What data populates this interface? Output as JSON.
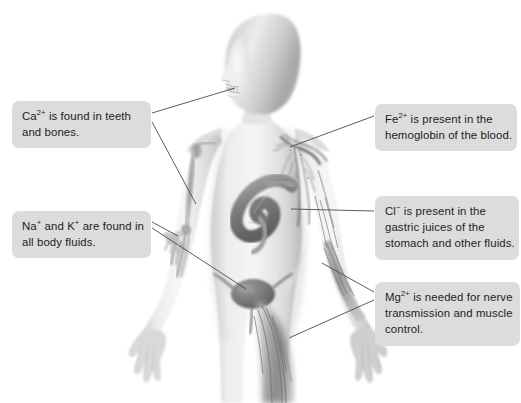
{
  "diagram": {
    "background_color": "#ffffff",
    "callout_fill": "#dcdcdc",
    "callout_text_color": "#1d1d1d",
    "leader_line_color": "#4b4b4b",
    "figure_tone_light": "#e8e8e8",
    "figure_tone_mid": "#b4b4b4",
    "figure_tone_dark": "#6e6e6e",
    "organ_tone": "#8a8a8a"
  },
  "callouts": [
    {
      "id": "calcium",
      "ion": "Ca",
      "charge": "2+",
      "lines": [
        "is found in teeth",
        "and bones."
      ],
      "line1_prefix": "Ca",
      "line1_rest": " is found in teeth",
      "line2": "and bones.",
      "targets": [
        "teeth-jaw",
        "arm-bones"
      ]
    },
    {
      "id": "sodium-potassium",
      "ion": "Na",
      "charge": "+",
      "ion2": "K",
      "charge2": "+",
      "line1_prefix": "Na",
      "line1_mid": " and K",
      "line1_rest": " are found in",
      "line2": "all body fluids.",
      "lines": [
        "Na+ and K+ are found in",
        "all body fluids."
      ],
      "targets": [
        "forearm-bones",
        "bladder"
      ]
    },
    {
      "id": "iron",
      "ion": "Fe",
      "charge": "2+",
      "line1_prefix": "Fe",
      "line1_rest": " is present in the",
      "line2": "hemoglobin of the blood.",
      "lines": [
        "Fe2+ is present in the",
        "hemoglobin of the blood."
      ],
      "targets": [
        "shoulder-blood-vessels"
      ]
    },
    {
      "id": "chloride",
      "ion": "Cl",
      "charge": "−",
      "line1_prefix": "Cl",
      "line1_rest": " is present in the",
      "line2": "gastric juices of the",
      "line3": "stomach and other fluids.",
      "lines": [
        "Cl- is present in the",
        "gastric juices of the",
        "stomach and other fluids."
      ],
      "targets": [
        "stomach"
      ]
    },
    {
      "id": "magnesium",
      "ion": "Mg",
      "charge": "2+",
      "line1_prefix": "Mg",
      "line1_rest": " is needed for nerve",
      "line2": "transmission and muscle",
      "line3": "control.",
      "lines": [
        "Mg2+ is needed for nerve",
        "transmission and muscle",
        "control."
      ],
      "targets": [
        "forearm-muscle",
        "thigh-muscle"
      ]
    }
  ],
  "anatomy_features": [
    {
      "name": "head-hair",
      "label": "head and hair silhouette"
    },
    {
      "name": "teeth-jaw",
      "label": "jaw and teeth"
    },
    {
      "name": "shoulder-blood-vessels",
      "label": "subclavian blood vessels"
    },
    {
      "name": "arm-bones",
      "label": "humerus and arm bones"
    },
    {
      "name": "forearm-bones",
      "label": "radius, ulna and wrist bones"
    },
    {
      "name": "stomach",
      "label": "stomach"
    },
    {
      "name": "bladder",
      "label": "urinary bladder"
    },
    {
      "name": "thigh-muscle",
      "label": "thigh musculature"
    },
    {
      "name": "forearm-muscle",
      "label": "forearm musculature"
    },
    {
      "name": "hand-left",
      "label": "left hand"
    },
    {
      "name": "hand-right",
      "label": "right hand"
    }
  ]
}
